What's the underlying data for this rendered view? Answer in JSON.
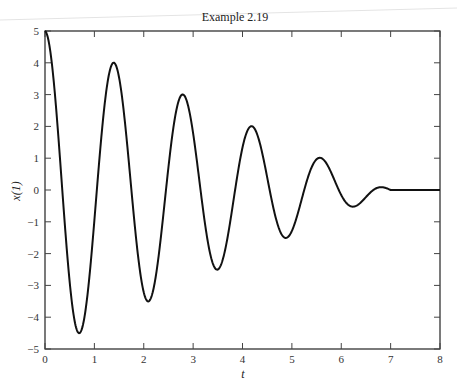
{
  "chart_data": {
    "type": "line",
    "title": "Example 2.19",
    "xlabel": "t",
    "ylabel": "x(1)",
    "xlim": [
      0,
      8
    ],
    "ylim": [
      -5,
      5
    ],
    "xticks": [
      0,
      1,
      2,
      3,
      4,
      5,
      6,
      7,
      8
    ],
    "yticks": [
      -5,
      -4,
      -3,
      -2,
      -1,
      0,
      1,
      2,
      3,
      4,
      5
    ],
    "grid": false,
    "legend": null,
    "model": {
      "description": "x(t) = (5 - t/1.4) * cos(2*pi*t/1.4) for 0<=t<=7, 0 for t>7",
      "amplitude0": 5,
      "period": 1.4,
      "end_t": 7
    },
    "series": [
      {
        "name": "x(1)",
        "color": "#111111",
        "x": [
          0,
          0.7,
          1.4,
          2.1,
          2.8,
          3.5,
          4.2,
          4.9,
          5.6,
          6.3,
          7.0,
          8.0
        ],
        "y": [
          5,
          -4.5,
          4,
          -3.5,
          3,
          -2.5,
          2,
          -1.5,
          1,
          -0.5,
          0,
          0
        ]
      }
    ]
  }
}
